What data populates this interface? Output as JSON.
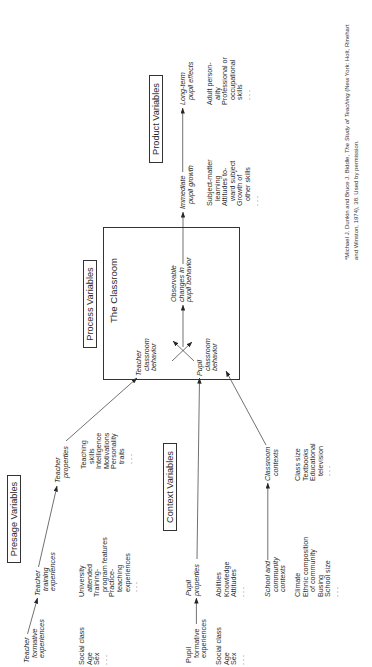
{
  "figure": {
    "presage": {
      "title": "Presage Variables",
      "teacher_formative": {
        "heading": [
          "Teacher",
          "formative",
          "experiences"
        ],
        "items": [
          "Social class",
          "Age",
          "Sex",
          ". . ."
        ]
      },
      "teacher_training": {
        "heading": [
          "Teacher",
          "training",
          "experiences"
        ],
        "items": [
          "University",
          "attended",
          "Training-",
          "program features",
          "Practice-",
          "teaching",
          "experiences",
          ". . ."
        ]
      },
      "teacher_properties": {
        "heading": [
          "Teacher",
          "properties"
        ],
        "items": [
          "Teaching",
          "skills",
          "Intelligence",
          "Motivations",
          "Personality",
          "traits",
          ". . ."
        ]
      }
    },
    "context": {
      "title": "Context Variables",
      "pupil_formative": {
        "heading": [
          "Pupil",
          "formative",
          "experiences"
        ],
        "items": [
          "Social class",
          "Age",
          "Sex",
          ". . ."
        ]
      },
      "pupil_properties": {
        "heading": [
          "Pupil",
          "properties"
        ],
        "items": [
          "Abilities",
          "Knowledge",
          "Attitudes",
          ". . ."
        ]
      },
      "school_community": {
        "heading": [
          "School and",
          "community",
          "contexts"
        ],
        "items": [
          "Climate",
          "Ethnic composition",
          "of community",
          "Busing",
          "School size",
          ". . ."
        ]
      },
      "classroom_contexts": {
        "heading": [
          "Classroom",
          "contexts"
        ],
        "items": [
          "Class size",
          "Textbooks",
          "Educational",
          "television",
          ". . ."
        ]
      }
    },
    "process": {
      "title": "Process Variables",
      "box_title": "The Classroom",
      "teacher_behavior": [
        "Teacher",
        "classroom",
        "behavior"
      ],
      "pupil_behavior": [
        "Pupil",
        "classroom",
        "behavior"
      ],
      "observable_changes": [
        "Observable",
        "changes in",
        "pupil behavior"
      ]
    },
    "product": {
      "title": "Product Variables",
      "immediate": {
        "heading": [
          "Immediate",
          "pupil growth"
        ],
        "items": [
          "Subject-matter",
          "learning",
          "Attitudes to-",
          "ward subject",
          "Growth of",
          "other skills",
          ". . ."
        ]
      },
      "long_term": {
        "heading": [
          "Long-term",
          "pupil effects"
        ],
        "items": [
          "Adult person-",
          "ality",
          "Professional or",
          "occupational",
          "skills",
          ". . ."
        ]
      }
    }
  },
  "footnote": {
    "line1_prefix": "*Michael J. Dunkin and Bruce J. Biddle, ",
    "line1_title": "The Study of Teaching",
    "line1_suffix": " (New York: Holt, Rinehart",
    "line2": "and Winston, 1974), 38. Used by permission."
  },
  "colors": {
    "ink": "#2b2b2b",
    "line": "#333333",
    "background": "#ffffff"
  }
}
